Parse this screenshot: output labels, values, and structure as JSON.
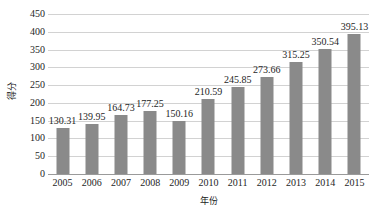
{
  "chart_data": {
    "type": "bar",
    "title": "",
    "subtitle": "",
    "xlabel": "年份",
    "ylabel": "得分",
    "categories": [
      "2005",
      "2006",
      "2007",
      "2008",
      "2009",
      "2010",
      "2011",
      "2012",
      "2013",
      "2014",
      "2015"
    ],
    "values": [
      130.31,
      139.95,
      164.73,
      177.25,
      150.16,
      210.59,
      245.85,
      273.66,
      315.25,
      350.54,
      395.13
    ],
    "data_labels": [
      "130.31",
      "139.95",
      "164.73",
      "177.25",
      "150.16",
      "210.59",
      "245.85",
      "273.66",
      "315.25",
      "350.54",
      "395.13"
    ],
    "ylim": [
      0,
      450
    ],
    "ytick_step": 50,
    "ytick_labels": [
      "450",
      "400",
      "350",
      "300",
      "250",
      "200",
      "150",
      "100",
      "50",
      "0"
    ],
    "ytick_values": [
      450,
      400,
      350,
      300,
      250,
      200,
      150,
      100,
      50,
      0
    ],
    "grid": true,
    "grid_axis": "y",
    "legend": false,
    "legend_position": "none",
    "series": [
      {
        "name": "得分",
        "values": [
          130.31,
          139.95,
          164.73,
          177.25,
          150.16,
          210.59,
          245.85,
          273.66,
          315.25,
          350.54,
          395.13
        ]
      }
    ]
  },
  "colors": {
    "bar_fill": "#8a8a8a",
    "gridline": "#d2d2d2",
    "baseline": "#9a9a9a",
    "text": "#1e1e1e",
    "background": "#ffffff"
  }
}
